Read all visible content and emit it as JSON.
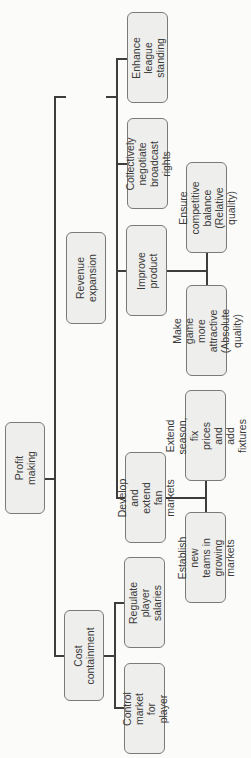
{
  "diagram": {
    "orientation": "rotated-90-ccw",
    "root": {
      "label": "Profit making",
      "children": [
        {
          "label": "Revenue expansion",
          "children": [
            {
              "label": "Enhance league\nstanding"
            },
            {
              "label": "Collectively\nnegotiate\nbroadcast rights"
            },
            {
              "label": "Improve product",
              "children": [
                {
                  "label": "Ensure competitive\nbalance (Relative\nquality)"
                },
                {
                  "label": "Make game more\nattractive (Absolute\nquality)"
                }
              ]
            },
            {
              "label": "Develop and extend\nfan markets",
              "children": [
                {
                  "label": "Extend season, fix\nprices and add\nfixtures"
                },
                {
                  "label": "Establish new\nteams in\ngrowing markets"
                }
              ]
            }
          ]
        },
        {
          "label": "Cost containment",
          "children": [
            {
              "label": "Regulate player\nsalaries"
            },
            {
              "label": "Control market for\nplayer"
            }
          ]
        }
      ]
    }
  },
  "nodes": {
    "profit_making": "Profit making",
    "revenue_expansion": "Revenue expansion",
    "cost_containment": "Cost containment",
    "enhance_league": "Enhance league\nstanding",
    "collectively_negotiate": "Collectively\nnegotiate\nbroadcast rights",
    "improve_product": "Improve product",
    "develop_fan_markets": "Develop and extend\nfan markets",
    "ensure_competitive": "Ensure competitive\nbalance (Relative\nquality)",
    "make_game_attractive": "Make game more\nattractive (Absolute\nquality)",
    "extend_season": "Extend season, fix\nprices and add\nfixtures",
    "establish_teams": "Establish new\nteams in\ngrowing markets",
    "regulate_salaries": "Regulate player\nsalaries",
    "control_market": "Control market for\nplayer"
  },
  "colors": {
    "node_fill": "#eeeeec",
    "node_border": "#7a7a78",
    "connector": "#3d3d3d",
    "text": "#3a3a3a"
  }
}
